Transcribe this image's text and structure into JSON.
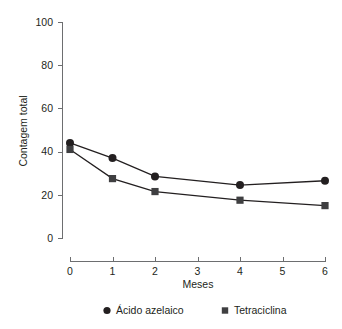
{
  "chart_data": {
    "type": "line",
    "title": "",
    "xlabel": "Meses",
    "ylabel": "Contagem total",
    "x": [
      0,
      1,
      2,
      4,
      6
    ],
    "xlim": [
      0,
      6
    ],
    "ylim": [
      0,
      100
    ],
    "x_ticks": [
      "0",
      "1",
      "2",
      "3",
      "4",
      "5",
      "6"
    ],
    "x_tick_values": [
      0,
      1,
      2,
      3,
      4,
      5,
      6
    ],
    "y_ticks": [
      "0",
      "20",
      "40",
      "60",
      "80",
      "100"
    ],
    "y_tick_values": [
      0,
      20,
      40,
      60,
      80,
      100
    ],
    "grid": false,
    "legend_position": "bottom",
    "series": [
      {
        "name": "Ácido azelaico",
        "marker": "circle",
        "color": "#231f20",
        "values": [
          44,
          37,
          28.5,
          24.5,
          26.5
        ]
      },
      {
        "name": "Tetraciclina",
        "marker": "square",
        "color": "#3f3f41",
        "values": [
          41,
          27.5,
          21.5,
          17.5,
          15
        ]
      }
    ]
  },
  "legend": {
    "items": [
      {
        "label": "Ácido azelaico",
        "marker": "circle-marker-icon"
      },
      {
        "label": "Tetraciclina",
        "marker": "square-marker-icon"
      }
    ]
  },
  "axes": {
    "y_axis_title": "Contagem total",
    "x_axis_title": "Meses"
  }
}
